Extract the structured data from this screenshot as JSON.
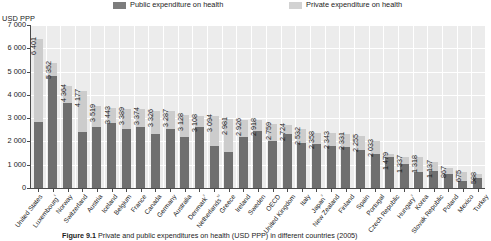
{
  "legend": {
    "public": "Public expenditure on health",
    "private": "Private expenditure on health"
  },
  "axis": {
    "unit": "USD PPP",
    "yticks": [
      "7 000",
      "6 000",
      "5 000",
      "4 000",
      "3 000",
      "2 000",
      "1 000",
      "0"
    ]
  },
  "caption": {
    "figure_number": "Figure 9.1",
    "text": "Private and public expenditures on health (USD PPP) in different countries (2005)"
  },
  "chart_data": {
    "type": "bar",
    "title": "Private and public expenditures on health (USD PPP) in different countries (2005)",
    "xlabel": "",
    "ylabel": "USD PPP",
    "ylim": [
      0,
      7000
    ],
    "ytick_step": 1000,
    "grid": true,
    "stacked": true,
    "legend_position": "top",
    "colors": {
      "public": "#6f6f6f",
      "private": "#cccccc"
    },
    "categories": [
      "United States",
      "Luxembourg¹",
      "Norway",
      "Switzerland",
      "Austria",
      "Iceland",
      "Belgium",
      "France",
      "Canada",
      "Germany",
      "Australia",
      "Denmark²",
      "Netherlands¹ ²",
      "Greece",
      "Ireland",
      "Sweden",
      "OECD",
      "United Kingdom",
      "Italy",
      "Japan²",
      "New Zealand",
      "Finland",
      "Spain",
      "Portugal",
      "Czech Republic",
      "Hungary²",
      "Korea",
      "Slovak Republic",
      "Poland",
      "Mexico",
      "Turkey"
    ],
    "totals": [
      6401,
      5352,
      4364,
      4177,
      3519,
      3443,
      3389,
      3374,
      3326,
      3287,
      3128,
      3108,
      3094,
      2981,
      2926,
      2918,
      2759,
      2724,
      2532,
      2358,
      2343,
      2331,
      2255,
      2033,
      1479,
      1337,
      1318,
      1137,
      867,
      675,
      588
    ],
    "series": [
      {
        "name": "Public expenditure on health",
        "values": [
          2850,
          4800,
          3630,
          2420,
          2620,
          2780,
          2540,
          2620,
          2300,
          2540,
          2180,
          2640,
          1810,
          1560,
          2200,
          2430,
          2020,
          2330,
          1930,
          1880,
          1820,
          1770,
          1630,
          1440,
          1330,
          1030,
          680,
          730,
          590,
          310,
          420
        ]
      },
      {
        "name": "Private expenditure on health",
        "values": [
          3551,
          552,
          734,
          1757,
          899,
          663,
          849,
          754,
          1026,
          747,
          948,
          468,
          1284,
          1421,
          726,
          488,
          739,
          394,
          602,
          478,
          523,
          561,
          625,
          593,
          149,
          307,
          638,
          407,
          277,
          365,
          168
        ]
      }
    ],
    "value_labels": [
      "6 401",
      "5 352",
      "4 364",
      "4 177",
      "3 519",
      "3 443",
      "3 389",
      "3 374",
      "3 326",
      "3 287",
      "3 128",
      "3 108",
      "3 094",
      "2 981",
      "2 926",
      "2 918",
      "2 759",
      "2 724",
      "2 532",
      "2 358",
      "2 343",
      "2 331",
      "2 255",
      "2 033",
      "1 479",
      "1 337",
      "1 318",
      "1 137",
      "867",
      "675",
      "588"
    ]
  }
}
